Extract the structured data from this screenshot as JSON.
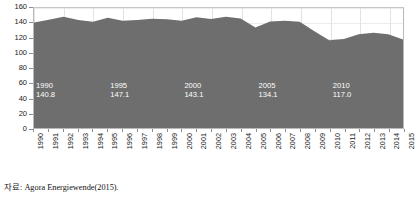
{
  "chart_data": {
    "type": "area",
    "title": "",
    "xlabel": "",
    "ylabel": "",
    "ylim": [
      0,
      160
    ],
    "yticks": [
      0,
      20,
      40,
      60,
      80,
      100,
      120,
      140,
      160
    ],
    "grid": true,
    "legend": null,
    "series_name": "",
    "fill_color": "#6e6e6e",
    "categories": [
      "1990",
      "1991",
      "1992",
      "1993",
      "1994",
      "1995",
      "1996",
      "1997",
      "1998",
      "1999",
      "2000",
      "2001",
      "2002",
      "2003",
      "2004",
      "2005",
      "2006",
      "2007",
      "2008",
      "2009",
      "2010",
      "2011",
      "2012",
      "2013",
      "2014",
      "2015"
    ],
    "values": [
      140.8,
      144.4,
      148.2,
      144.1,
      141.6,
      147.1,
      143.0,
      144.1,
      145.6,
      145.0,
      143.1,
      147.5,
      145.2,
      148.5,
      146.1,
      134.1,
      142.0,
      143.0,
      141.6,
      129.0,
      117.0,
      118.5,
      125.0,
      127.0,
      125.0,
      118.0
    ],
    "annotations": [
      {
        "year": "1990",
        "value": "140.8"
      },
      {
        "year": "1995",
        "value": "147.1"
      },
      {
        "year": "2000",
        "value": "143.1"
      },
      {
        "year": "2005",
        "value": "134.1"
      },
      {
        "year": "2010",
        "value": "117.0"
      },
      {
        "year": "2015",
        "value": "118.0"
      }
    ]
  },
  "footnote": {
    "text": "자료: Agora Energiewende(2015)."
  }
}
